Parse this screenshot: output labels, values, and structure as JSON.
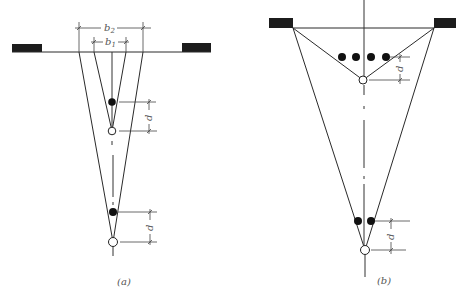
{
  "figure": {
    "panels": [
      {
        "id": "a",
        "caption": "(a)",
        "dimensions": {
          "outer_width_label": "b2",
          "inner_width_label": "b1",
          "spacing_upper_label": "d",
          "spacing_lower_label": "d"
        },
        "elements": {
          "supports": 2,
          "filled_points": 2,
          "open_points": 2
        }
      },
      {
        "id": "b",
        "caption": "(b)",
        "dimensions": {
          "spacing_upper_label": "d",
          "spacing_lower_label": "d"
        },
        "elements": {
          "supports": 2,
          "filled_points_upper_row": 4,
          "filled_points_lower_row": 2,
          "open_points": 2
        }
      }
    ],
    "labels": {
      "b2_main": "b",
      "b2_sub": "2",
      "b1_main": "b",
      "b1_sub": "1",
      "d": "d",
      "caption_a": "(a)",
      "caption_b": "(b)"
    },
    "colors": {
      "line": "#2a2a2a",
      "fill": "#111111",
      "background": "#ffffff"
    }
  }
}
